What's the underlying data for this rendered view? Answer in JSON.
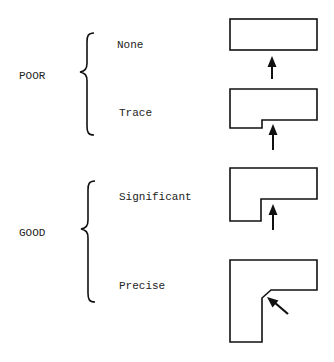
{
  "diagram": {
    "colors": {
      "background": "#ffffff",
      "stroke": "#111111",
      "text": "#222222"
    },
    "groups": [
      {
        "label": "POOR",
        "levels": [
          "None",
          "Trace"
        ]
      },
      {
        "label": "GOOD",
        "levels": [
          "Significant",
          "Precise"
        ]
      }
    ],
    "levels": [
      {
        "label": "None",
        "shape": "plain-rectangle",
        "arrow": "up-arrow-between-shapes"
      },
      {
        "label": "Trace",
        "shape": "rectangle-with-small-step",
        "arrow": "up-arrow-into-step"
      },
      {
        "label": "Significant",
        "shape": "l-shape-sharp-inner-corner",
        "arrow": "up-arrow-into-corner"
      },
      {
        "label": "Precise",
        "shape": "l-shape-chamfered-inner-corner",
        "arrow": "diagonal-arrow-into-chamfer"
      }
    ]
  }
}
